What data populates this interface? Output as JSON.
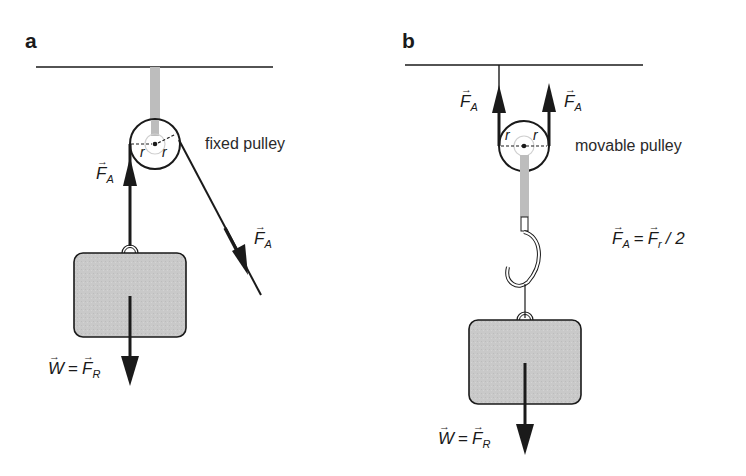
{
  "figure": {
    "panel_a": {
      "letter": "a",
      "caption": "fixed pulley",
      "pulley_radius_label_left": "r",
      "pulley_radius_label_right": "r",
      "force_up": {
        "symbol": "F",
        "subscript": "A"
      },
      "force_diagonal": {
        "symbol": "F",
        "subscript": "A"
      },
      "weight_eq": {
        "lhs": "W",
        "equals": "=",
        "rhs_symbol": "F",
        "rhs_subscript": "R"
      }
    },
    "panel_b": {
      "letter": "b",
      "caption": "movable pulley",
      "pulley_radius_label_left": "r",
      "pulley_radius_label_right": "r",
      "force_left": {
        "symbol": "F",
        "subscript": "A"
      },
      "force_right": {
        "symbol": "F",
        "subscript": "A"
      },
      "relation": {
        "lhs_symbol": "F",
        "lhs_subscript": "A",
        "equals": "=",
        "rhs_symbol": "F",
        "rhs_subscript": "r",
        "divisor": "/ 2"
      },
      "weight_eq": {
        "lhs": "W",
        "equals": "=",
        "rhs_symbol": "F",
        "rhs_subscript": "R"
      }
    },
    "colors": {
      "line": "#1a1a1a",
      "rod_gray": "#bdbdbd",
      "weight_fill": "#c8c8c8",
      "axle_ring": "#d0d0d0"
    },
    "vector_arrow_glyph": "→"
  }
}
